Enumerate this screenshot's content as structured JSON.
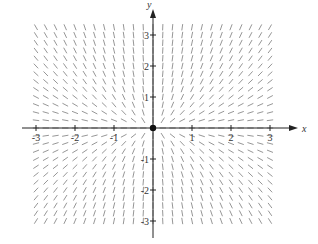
{
  "chart_data": {
    "type": "direction_field",
    "title": "",
    "xlabel": "x",
    "ylabel": "y",
    "xlim": [
      -3.2,
      3.2
    ],
    "ylim": [
      -3.2,
      3.4
    ],
    "x_ticks": [
      -3,
      -2,
      -1,
      1,
      2,
      3
    ],
    "y_ticks": [
      -3,
      -2,
      -1,
      1,
      2,
      3
    ],
    "x_tick_labels": [
      "-3",
      "-2",
      "-1",
      "1",
      "2",
      "3"
    ],
    "y_tick_labels": [
      "-3",
      "-2",
      "-1",
      "1",
      "2",
      "3"
    ],
    "grid": false,
    "field": {
      "dx": "x",
      "dy": "2y",
      "description": "unstable node at origin; segments point outward, vertical near y-axis, horizontal near x-axis"
    },
    "equilibrium_point": {
      "x": 0,
      "y": 0
    },
    "sample_spacing": 0.25,
    "colors": {
      "axis": "#222222",
      "segments": "#8a8a8a",
      "point": "#111111"
    }
  }
}
